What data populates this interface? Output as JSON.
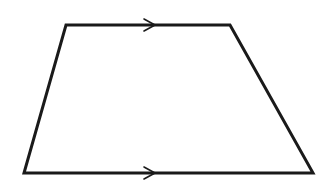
{
  "diagram": {
    "type": "trapezoid",
    "stroke_color": "#1a1a1a",
    "background": "#ffffff",
    "stroke_width": 3,
    "vertices": {
      "top_left": [
        66,
        25
      ],
      "top_right": [
        230,
        25
      ],
      "bottom_right": [
        313,
        173
      ],
      "bottom_left": [
        24,
        173
      ]
    },
    "parallel_markers": [
      {
        "side": "top",
        "tip": [
          155,
          25
        ],
        "length": 11,
        "half_width": 6
      },
      {
        "side": "bottom",
        "tip": [
          155,
          173
        ],
        "length": 11,
        "half_width": 6
      }
    ]
  }
}
